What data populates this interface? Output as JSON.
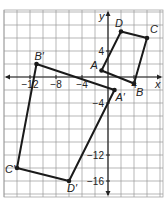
{
  "figure": {
    "type": "coordinate-plane-transformation",
    "axes": {
      "x_label": "x",
      "y_label": "y"
    },
    "x_ticks": [
      {
        "value": -12,
        "label": "−12"
      },
      {
        "value": -8,
        "label": "−8"
      },
      {
        "value": -4,
        "label": "−4"
      },
      {
        "value": 4,
        "label": "4"
      }
    ],
    "y_ticks": [
      {
        "value": 4,
        "label": "4"
      },
      {
        "value": -4,
        "label": "−4"
      },
      {
        "value": -12,
        "label": "−12"
      },
      {
        "value": -16,
        "label": "−16"
      }
    ],
    "original": {
      "name": "ABCD",
      "vertices": [
        {
          "label": "A",
          "x": -1,
          "y": 1
        },
        {
          "label": "B",
          "x": 4,
          "y": -1
        },
        {
          "label": "C",
          "x": 6,
          "y": 6
        },
        {
          "label": "D",
          "x": 2,
          "y": 7
        }
      ]
    },
    "image": {
      "name": "A'B'C'D'",
      "vertices": [
        {
          "label": "A′",
          "x": 1,
          "y": -2
        },
        {
          "label": "B′",
          "x": -11,
          "y": 2
        },
        {
          "label": "C′",
          "x": -14,
          "y": -14
        },
        {
          "label": "D′",
          "x": -6,
          "y": -16
        }
      ]
    },
    "colors": {
      "grid": "#999999",
      "axis": "#222222",
      "shape": "#1a1a1a"
    }
  }
}
